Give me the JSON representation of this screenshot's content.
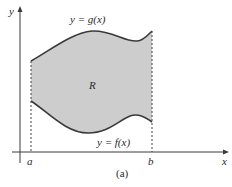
{
  "figure": {
    "caption": "(a)",
    "region_label": "R",
    "top_curve_label": "y = g(x)",
    "bottom_curve_label": "y = f(x)",
    "x_axis_label": "x",
    "y_axis_label": "y",
    "a_label": "a",
    "b_label": "b",
    "colors": {
      "region_fill": "#cdcdcd",
      "curve": "#3a3a3a",
      "axis": "#3a3a3a",
      "dashed": "#444444"
    }
  }
}
